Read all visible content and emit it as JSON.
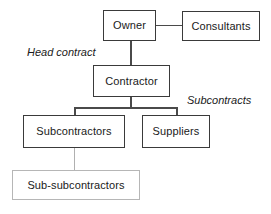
{
  "diagram": {
    "nodes": {
      "owner": {
        "label": "Owner"
      },
      "consultants": {
        "label": "Consultants"
      },
      "contractor": {
        "label": "Contractor"
      },
      "subcontractors": {
        "label": "Subcontractors"
      },
      "suppliers": {
        "label": "Suppliers"
      },
      "subsubcontractors": {
        "label": "Sub-subcontractors"
      }
    },
    "annotations": {
      "head_contract": "Head contract",
      "subcontracts": "Subcontracts"
    },
    "colors": {
      "background": "#ffffff",
      "box_border_strong": "#3a3a3a",
      "box_border_faint": "#b6b6b6",
      "edge_strong": "#4a4a4a",
      "edge_faint": "#b0b0b0",
      "text": "#1a1a1a"
    }
  }
}
